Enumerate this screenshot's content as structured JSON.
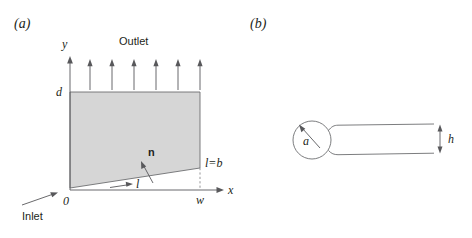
{
  "figure": {
    "panels": [
      {
        "id": "a",
        "caption": "(a)",
        "labels": {
          "axis_y": "y",
          "axis_x": "x",
          "origin": "0",
          "height": "d",
          "width": "w",
          "outlet": "Outlet",
          "inlet": "Inlet",
          "normal": "n",
          "arclength": "l",
          "arclength_max": "l=b"
        }
      },
      {
        "id": "b",
        "caption": "(b)",
        "labels": {
          "radius": "a",
          "gap": "h"
        }
      }
    ],
    "colors": {
      "shade_fill": "#d6d6d6",
      "outline": "#6d6e71",
      "text": "#231f20",
      "background": "#ffffff"
    },
    "geometry": {
      "panel_a": {
        "origin_px": [
          70,
          190
        ],
        "y_axis_top_px": [
          70,
          58
        ],
        "x_axis_right_px": [
          224,
          190
        ],
        "shaded_polygon_px": "70,188 200,168 200,92 70,92",
        "dashed_drop_px": [
          200,
          168,
          200,
          190
        ],
        "outlet_arrow_count": 6,
        "outlet_arrow_x_px": [
          90,
          112,
          134,
          156,
          178,
          200
        ],
        "outlet_arrow_y_top_px": 60,
        "outlet_arrow_y_base_px": 90
      },
      "panel_b": {
        "circle_center_px": [
          312,
          140
        ],
        "circle_radius_px": 19,
        "tube_right_px": 434,
        "gap_arrow_x_px": 440
      }
    }
  }
}
